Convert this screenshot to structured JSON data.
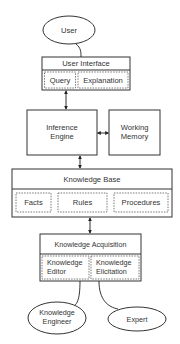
{
  "diagram": {
    "nodes": {
      "user": {
        "label": "User",
        "shape": "ellipse"
      },
      "user_interface": {
        "label": "User Interface",
        "components": [
          {
            "label": "Query"
          },
          {
            "label": "Explanation"
          }
        ]
      },
      "inference_engine": {
        "label_line1": "Inference",
        "label_line2": "Engine"
      },
      "working_memory": {
        "label_line1": "Working",
        "label_line2": "Memory"
      },
      "knowledge_base": {
        "label": "Knowledge Base",
        "components": [
          {
            "label": "Facts"
          },
          {
            "label": "Rules"
          },
          {
            "label": "Procedures"
          }
        ]
      },
      "knowledge_acquisition": {
        "label": "Knowledge Acquisition",
        "components": [
          {
            "label_line1": "Knowledge",
            "label_line2": "Editor"
          },
          {
            "label_line1": "Knowledge",
            "label_line2": "Elicitation"
          }
        ]
      },
      "knowledge_engineer": {
        "label_line1": "Knowledge",
        "label_line2": "Engineer",
        "shape": "ellipse"
      },
      "expert": {
        "label": "Expert",
        "shape": "ellipse"
      }
    },
    "edges": [
      {
        "from": "user",
        "to": "user_interface",
        "type": "curve"
      },
      {
        "from": "user_interface",
        "to": "inference_engine",
        "type": "bidirectional"
      },
      {
        "from": "inference_engine",
        "to": "working_memory",
        "type": "bidirectional"
      },
      {
        "from": "inference_engine",
        "to": "knowledge_base",
        "type": "bidirectional"
      },
      {
        "from": "knowledge_base",
        "to": "knowledge_acquisition",
        "type": "bidirectional"
      },
      {
        "from": "knowledge_engineer",
        "to": "knowledge_acquisition",
        "type": "curve"
      },
      {
        "from": "expert",
        "to": "knowledge_acquisition",
        "type": "curve"
      }
    ],
    "colors": {
      "stroke": "#333333",
      "fill": "#ffffff",
      "text": "#333333"
    }
  }
}
